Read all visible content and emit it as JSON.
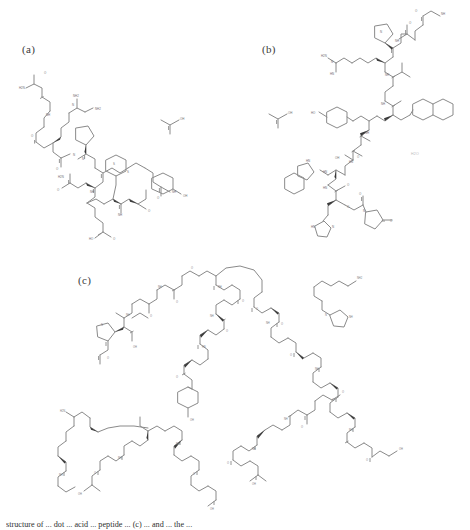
{
  "figure": {
    "background_color": "#ffffff",
    "bond_color": "#8a8a8a",
    "stereo_color": "#3a3a3a",
    "label_color": "#3a3a3a",
    "panels": [
      {
        "label": "(a)",
        "title": "peptide structure a",
        "counterion": "OH",
        "counterion_name": "acetic acid"
      },
      {
        "label": "(b)",
        "title": "peptide structure b",
        "counterion": "OH",
        "counterion_name": "acetic acid",
        "note": "H2O"
      },
      {
        "label": "(c)",
        "title": "peptide structure c"
      }
    ],
    "atom_labels": {
      "amine": "H2N",
      "amide_nh": "NH",
      "nitrogen": "N",
      "hydroxyl": "OH",
      "oxygen": "O",
      "sulfur": "S",
      "hn": "HN",
      "nh2": "NH2",
      "ho": "HO"
    },
    "caption": "structure of ... dot ... acid ... peptide ... (c) ... and ... the ..."
  }
}
